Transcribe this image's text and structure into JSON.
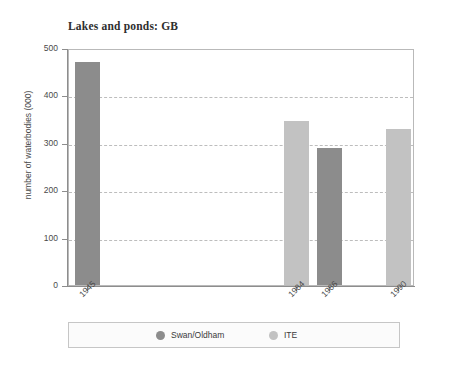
{
  "chart_data": {
    "type": "bar",
    "title": "Lakes and ponds: GB",
    "xlabel": "",
    "ylabel": "number of waterbodies (000)",
    "ylim": [
      0,
      500
    ],
    "ytick_labels": [
      "0",
      "100",
      "200",
      "300",
      "400",
      "500"
    ],
    "yticks": [
      0,
      100,
      200,
      300,
      400,
      500
    ],
    "gridlines": [
      100,
      200,
      300,
      400
    ],
    "grid": "horizontal-dashed",
    "legend_position": "below-axes",
    "categories": [
      "1945",
      "1984",
      "1986",
      "1990"
    ],
    "series": [
      {
        "name": "Swan/Oldham",
        "color": "#8c8c8c",
        "values": [
          470,
          null,
          290,
          null
        ]
      },
      {
        "name": "ITE",
        "color": "#c2c2c2",
        "values": [
          null,
          345,
          null,
          330
        ]
      }
    ],
    "bars": [
      {
        "category": "1945",
        "series": "Swan/Oldham",
        "value": 470,
        "color": "#8c8c8c"
      },
      {
        "category": "1984",
        "series": "ITE",
        "value": 345,
        "color": "#c2c2c2"
      },
      {
        "category": "1986",
        "series": "Swan/Oldham",
        "value": 290,
        "color": "#8c8c8c"
      },
      {
        "category": "1990",
        "series": "ITE",
        "value": 330,
        "color": "#c2c2c2"
      }
    ]
  },
  "legend": {
    "items": [
      {
        "label": "Swan/Oldham",
        "color": "#8c8c8c"
      },
      {
        "label": "ITE",
        "color": "#c2c2c2"
      }
    ]
  },
  "colors": {
    "swan_oldham": "#8c8c8c",
    "ite": "#c2c2c2",
    "frame": "#b9b9b9",
    "grid": "#bdbdbd",
    "axis": "#8d8d8d",
    "text": "#3a3a3a",
    "background": "#ffffff"
  }
}
